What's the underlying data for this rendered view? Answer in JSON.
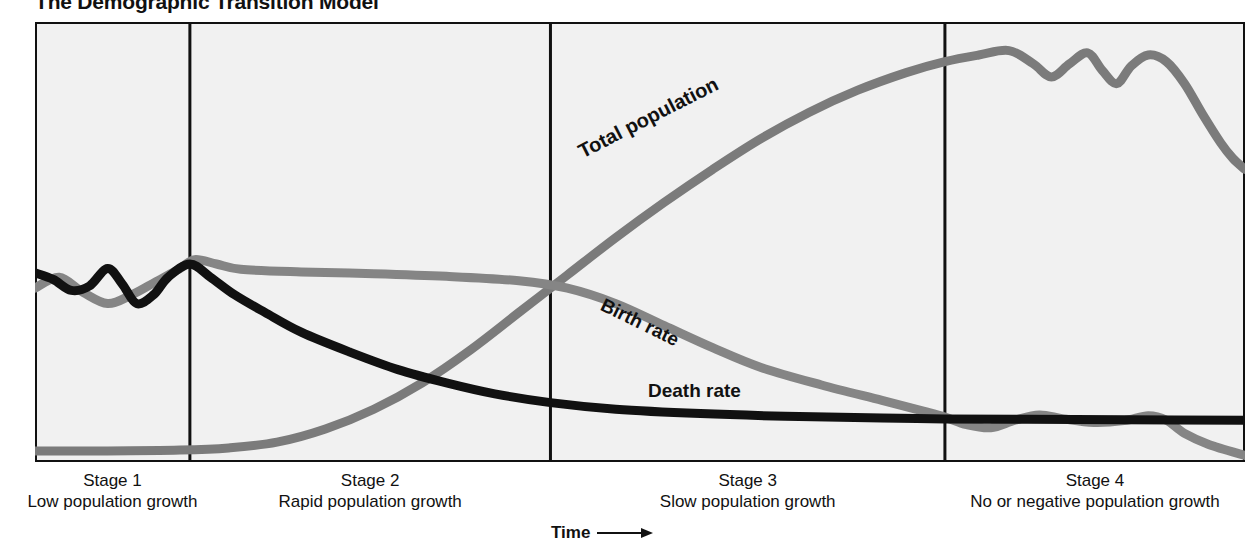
{
  "title": "The Demographic Transition Model",
  "axis": {
    "x_label": "Time",
    "arrow_icon": "right-arrow-icon"
  },
  "colors": {
    "background": "#ffffff",
    "plot_fill": "#f1f1f1",
    "frame": "#111111",
    "divider": "#111111",
    "death_rate": "#111111",
    "birth_rate": "#858585",
    "total_population": "#7b7b7b"
  },
  "series_labels": {
    "total_population": "Total population",
    "birth_rate": "Birth rate",
    "death_rate": "Death rate"
  },
  "stages": [
    {
      "name": "Stage 1",
      "description": "Low population growth"
    },
    {
      "name": "Stage 2",
      "description": "Rapid population growth"
    },
    {
      "name": "Stage 3",
      "description": "Slow population growth"
    },
    {
      "name": "Stage 4",
      "description": "No or negative population growth"
    }
  ],
  "chart_data": {
    "type": "line",
    "title": "The Demographic Transition Model",
    "xlabel": "Time",
    "ylabel": "",
    "grid": false,
    "legend": "inline-curve-labels",
    "xlim": [
      0,
      100
    ],
    "ylim": [
      0,
      100
    ],
    "stage_boundaries_x": [
      12.8,
      42.6,
      75.2
    ],
    "series": [
      {
        "name": "Death rate",
        "color": "#111111",
        "points_xy": [
          [
            0.0,
            57.0
          ],
          [
            1.5,
            58.5
          ],
          [
            3.0,
            61.0
          ],
          [
            4.5,
            60.0
          ],
          [
            6.0,
            56.0
          ],
          [
            7.2,
            59.5
          ],
          [
            8.4,
            64.0
          ],
          [
            9.8,
            62.0
          ],
          [
            11.0,
            58.0
          ],
          [
            12.8,
            55.0
          ],
          [
            14.5,
            58.0
          ],
          [
            16.5,
            62.0
          ],
          [
            19.0,
            66.0
          ],
          [
            22.0,
            70.5
          ],
          [
            26.0,
            75.0
          ],
          [
            30.0,
            79.0
          ],
          [
            34.0,
            82.0
          ],
          [
            38.0,
            84.5
          ],
          [
            42.6,
            86.5
          ],
          [
            48.0,
            88.0
          ],
          [
            55.0,
            89.0
          ],
          [
            62.0,
            89.6
          ],
          [
            70.0,
            90.0
          ],
          [
            75.2,
            90.2
          ],
          [
            82.0,
            90.3
          ],
          [
            90.0,
            90.4
          ],
          [
            100.0,
            90.5
          ]
        ]
      },
      {
        "name": "Birth rate",
        "color": "#858585",
        "points_xy": [
          [
            0.0,
            60.5
          ],
          [
            2.0,
            58.0
          ],
          [
            4.0,
            61.5
          ],
          [
            6.0,
            64.0
          ],
          [
            8.0,
            62.0
          ],
          [
            10.0,
            59.0
          ],
          [
            12.0,
            56.0
          ],
          [
            13.2,
            54.0
          ],
          [
            15.0,
            55.0
          ],
          [
            17.0,
            56.2
          ],
          [
            22.0,
            56.8
          ],
          [
            28.0,
            57.2
          ],
          [
            34.0,
            57.8
          ],
          [
            40.0,
            58.8
          ],
          [
            44.0,
            60.5
          ],
          [
            48.0,
            64.0
          ],
          [
            52.0,
            69.0
          ],
          [
            56.0,
            74.0
          ],
          [
            60.0,
            78.5
          ],
          [
            65.0,
            82.5
          ],
          [
            70.0,
            86.0
          ],
          [
            73.5,
            88.5
          ],
          [
            75.2,
            89.8
          ],
          [
            77.0,
            91.5
          ],
          [
            79.0,
            92.2
          ],
          [
            81.0,
            90.5
          ],
          [
            83.0,
            89.3
          ],
          [
            85.0,
            90.2
          ],
          [
            87.5,
            91.0
          ],
          [
            90.0,
            90.6
          ],
          [
            92.0,
            89.5
          ],
          [
            93.5,
            90.5
          ],
          [
            95.0,
            93.5
          ],
          [
            97.0,
            96.0
          ],
          [
            100.0,
            98.5
          ]
        ]
      },
      {
        "name": "Total population",
        "color": "#7b7b7b",
        "points_xy": [
          [
            0.0,
            97.5
          ],
          [
            6.0,
            97.5
          ],
          [
            12.0,
            97.3
          ],
          [
            16.0,
            96.8
          ],
          [
            20.0,
            95.5
          ],
          [
            24.0,
            92.5
          ],
          [
            28.0,
            88.0
          ],
          [
            32.0,
            82.0
          ],
          [
            36.0,
            74.5
          ],
          [
            40.0,
            66.0
          ],
          [
            44.0,
            57.5
          ],
          [
            48.0,
            49.0
          ],
          [
            52.0,
            41.0
          ],
          [
            56.0,
            33.5
          ],
          [
            60.0,
            26.5
          ],
          [
            64.0,
            20.5
          ],
          [
            68.0,
            15.5
          ],
          [
            72.0,
            11.5
          ],
          [
            75.2,
            9.0
          ],
          [
            78.0,
            7.5
          ],
          [
            80.5,
            6.5
          ],
          [
            82.5,
            9.5
          ],
          [
            84.0,
            12.5
          ],
          [
            85.5,
            9.5
          ],
          [
            87.0,
            7.0
          ],
          [
            88.2,
            11.0
          ],
          [
            89.4,
            14.0
          ],
          [
            90.6,
            10.0
          ],
          [
            92.0,
            7.5
          ],
          [
            93.5,
            9.0
          ],
          [
            95.0,
            14.0
          ],
          [
            96.5,
            21.0
          ],
          [
            98.0,
            27.5
          ],
          [
            99.0,
            31.0
          ],
          [
            100.0,
            33.5
          ]
        ]
      }
    ]
  }
}
